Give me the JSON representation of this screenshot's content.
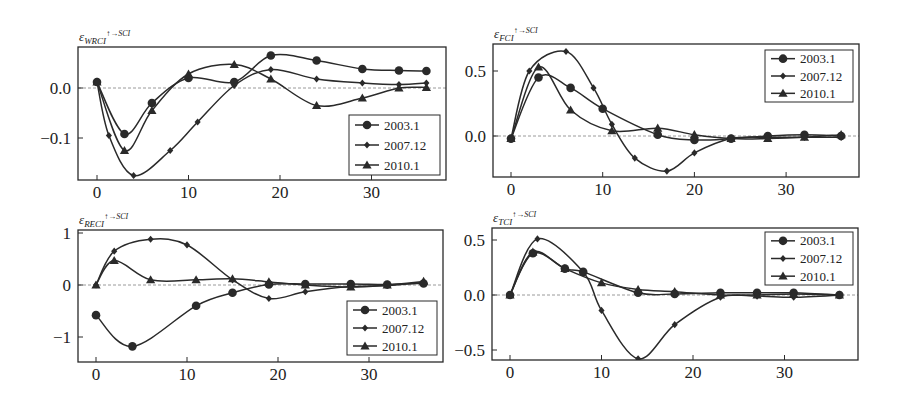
{
  "figure": {
    "width": 899,
    "height": 406,
    "background": "#ffffff",
    "line_color": "#2a2a2a",
    "zero_line_color": "#9a9a9a"
  },
  "legend_entries": [
    {
      "label": "2003.1",
      "marker": "circle"
    },
    {
      "label": "2007.12",
      "marker": "diamond"
    },
    {
      "label": "2010.1",
      "marker": "triangle"
    }
  ],
  "chart_data": [
    {
      "type": "line",
      "title": "ε_WRCI ↑→SCI",
      "title_main": "ε",
      "title_sub": "WRCI",
      "title_sup": "↑→SCI",
      "xlabel": "",
      "ylabel": "",
      "xlim": [
        -2,
        38
      ],
      "ylim": [
        -0.185,
        0.085
      ],
      "xticks": [
        0,
        10,
        20,
        30
      ],
      "xtick_labels": [
        "0",
        "10",
        "20",
        "30"
      ],
      "yticks": [
        0.0,
        -0.1
      ],
      "ytick_labels": [
        "0.0",
        "−0.1"
      ],
      "grid": false,
      "zero_line": true,
      "legend_position": "lower right",
      "box": {
        "x0": 78,
        "y0": 47,
        "x1": 446,
        "y1": 180
      },
      "map": {
        "x0px": 97,
        "xscale": 9.15,
        "y0px": 88,
        "yscale": 500
      },
      "legend_box": {
        "x": 349,
        "y": 115,
        "w": 91,
        "h": 60
      },
      "series": [
        {
          "name": "2003.1",
          "marker": "circle",
          "x": [
            0,
            3,
            6,
            10,
            15,
            19,
            24,
            29,
            33,
            36
          ],
          "y": [
            0.012,
            -0.092,
            -0.03,
            0.02,
            0.012,
            0.065,
            0.055,
            0.038,
            0.035,
            0.034
          ]
        },
        {
          "name": "2007.12",
          "marker": "diamond",
          "x": [
            0,
            1.3,
            4,
            8,
            11,
            15,
            19,
            24,
            29,
            33,
            36
          ],
          "y": [
            0.012,
            -0.095,
            -0.175,
            -0.125,
            -0.068,
            0.005,
            0.037,
            0.018,
            0.01,
            0.007,
            0.01
          ]
        },
        {
          "name": "2010.1",
          "marker": "triangle",
          "x": [
            0,
            3,
            6,
            10,
            15,
            19,
            24,
            29,
            33,
            36
          ],
          "y": [
            0.012,
            -0.125,
            -0.045,
            0.028,
            0.047,
            0.018,
            -0.035,
            -0.02,
            0.0,
            0.001
          ]
        }
      ]
    },
    {
      "type": "line",
      "title": "ε_FCI ↑→SCI",
      "title_main": "ε",
      "title_sub": "FCI",
      "title_sup": "↑→SCI",
      "xlabel": "",
      "ylabel": "",
      "xlim": [
        -2,
        38
      ],
      "ylim": [
        -0.31,
        0.71
      ],
      "xticks": [
        0,
        10,
        20,
        30
      ],
      "xtick_labels": [
        "0",
        "10",
        "20",
        "30"
      ],
      "yticks": [
        0.5,
        0.0
      ],
      "ytick_labels": [
        "0.5",
        "0.0"
      ],
      "grid": false,
      "zero_line": true,
      "legend_position": "upper right",
      "box": {
        "x0": 493,
        "y0": 44,
        "x1": 859,
        "y1": 177
      },
      "map": {
        "x0px": 511,
        "xscale": 9.17,
        "y0px": 136,
        "yscale": 130
      },
      "legend_box": {
        "x": 765,
        "y": 50,
        "w": 88,
        "h": 52
      },
      "series": [
        {
          "name": "2003.1",
          "marker": "circle",
          "x": [
            0,
            3,
            6.5,
            10,
            16,
            20,
            24,
            28,
            32,
            36
          ],
          "y": [
            -0.02,
            0.45,
            0.37,
            0.21,
            0.01,
            -0.03,
            -0.02,
            0.0,
            0.01,
            0.0
          ]
        },
        {
          "name": "2007.12",
          "marker": "diamond",
          "x": [
            0,
            2,
            6,
            9,
            11,
            13.5,
            17,
            20,
            24,
            28,
            32,
            36
          ],
          "y": [
            -0.02,
            0.5,
            0.65,
            0.37,
            0.09,
            -0.17,
            -0.27,
            -0.13,
            -0.02,
            -0.01,
            -0.01,
            -0.01
          ]
        },
        {
          "name": "2010.1",
          "marker": "triangle",
          "x": [
            0,
            3,
            6.5,
            11,
            16,
            20,
            24,
            28,
            32,
            36
          ],
          "y": [
            -0.02,
            0.53,
            0.2,
            0.04,
            0.06,
            0.01,
            -0.02,
            -0.02,
            -0.01,
            0.01
          ]
        }
      ]
    },
    {
      "type": "line",
      "title": "ε_RECI ↑→SCI",
      "title_main": "ε",
      "title_sub": "RECI",
      "title_sup": "↑→SCI",
      "xlabel": "",
      "ylabel": "",
      "xlim": [
        -2,
        38
      ],
      "ylim": [
        -1.4,
        1.05
      ],
      "xticks": [
        0,
        10,
        20,
        30
      ],
      "xtick_labels": [
        "0",
        "10",
        "20",
        "30"
      ],
      "yticks": [
        1,
        0,
        -1
      ],
      "ytick_labels": [
        "1",
        "0",
        "−1"
      ],
      "grid": false,
      "zero_line": true,
      "legend_position": "lower right",
      "box": {
        "x0": 78,
        "y0": 230,
        "x1": 443,
        "y1": 362
      },
      "map": {
        "x0px": 96,
        "xscale": 9.1,
        "y0px": 285,
        "yscale": 52
      },
      "legend_box": {
        "x": 347,
        "y": 301,
        "w": 90,
        "h": 54
      },
      "series": [
        {
          "name": "2003.1",
          "marker": "circle",
          "x": [
            0,
            4,
            11,
            15,
            19,
            23,
            28,
            32,
            36
          ],
          "y": [
            -0.58,
            -1.18,
            -0.4,
            -0.15,
            0.01,
            0.02,
            0.02,
            0.01,
            0.03
          ]
        },
        {
          "name": "2007.12",
          "marker": "diamond",
          "x": [
            0,
            2,
            6,
            10,
            15,
            19,
            23,
            28,
            32,
            36
          ],
          "y": [
            0.0,
            0.65,
            0.88,
            0.77,
            0.1,
            -0.26,
            -0.13,
            -0.03,
            -0.01,
            0.05
          ]
        },
        {
          "name": "2010.1",
          "marker": "triangle",
          "x": [
            0,
            2,
            6,
            11,
            15,
            19,
            23,
            28,
            32,
            36
          ],
          "y": [
            0.0,
            0.47,
            0.1,
            0.1,
            0.12,
            0.06,
            0.0,
            -0.04,
            0.0,
            0.07
          ]
        }
      ]
    },
    {
      "type": "line",
      "title": "ε_TCI ↑→SCI",
      "title_main": "ε",
      "title_sub": "TCI",
      "title_sup": "↑→SCI",
      "xlabel": "",
      "ylabel": "",
      "xlim": [
        -2,
        38
      ],
      "ylim": [
        -0.59,
        0.61
      ],
      "xticks": [
        0,
        10,
        20,
        30
      ],
      "xtick_labels": [
        "0",
        "10",
        "20",
        "30"
      ],
      "yticks": [
        0.5,
        0.0,
        -0.5
      ],
      "ytick_labels": [
        "0.5",
        "0.0",
        "−0.5"
      ],
      "grid": false,
      "zero_line": true,
      "legend_position": "upper right",
      "box": {
        "x0": 492,
        "y0": 228,
        "x1": 858,
        "y1": 360
      },
      "map": {
        "x0px": 510,
        "xscale": 9.15,
        "y0px": 295,
        "yscale": 110
      },
      "legend_box": {
        "x": 765,
        "y": 232,
        "w": 88,
        "h": 53
      },
      "series": [
        {
          "name": "2003.1",
          "marker": "circle",
          "x": [
            0,
            2.5,
            6,
            8,
            14,
            18,
            23,
            27,
            31,
            36
          ],
          "y": [
            0.0,
            0.38,
            0.24,
            0.21,
            0.02,
            0.01,
            0.02,
            0.02,
            0.02,
            0.0
          ]
        },
        {
          "name": "2007.12",
          "marker": "diamond",
          "x": [
            0,
            3,
            8,
            10,
            14,
            18,
            23,
            27,
            31,
            36
          ],
          "y": [
            0.0,
            0.51,
            0.21,
            -0.14,
            -0.58,
            -0.27,
            -0.02,
            -0.01,
            -0.02,
            0.0
          ]
        },
        {
          "name": "2010.1",
          "marker": "triangle",
          "x": [
            0,
            2.5,
            6,
            10,
            14,
            18,
            23,
            27,
            31,
            36
          ],
          "y": [
            0.0,
            0.39,
            0.24,
            0.11,
            0.05,
            0.03,
            0.0,
            0.0,
            0.01,
            0.0
          ]
        }
      ]
    }
  ]
}
